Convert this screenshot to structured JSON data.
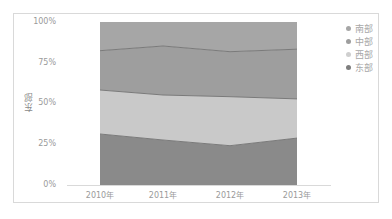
{
  "chart_data": {
    "type": "area",
    "stacked": true,
    "normalized": true,
    "title": "",
    "xlabel": "",
    "ylabel": "东部",
    "ylim": [
      0,
      100
    ],
    "y_tick_labels": [
      "0%",
      "25%",
      "50%",
      "75%",
      "100%"
    ],
    "categories": [
      "2010年",
      "2011年",
      "2012年",
      "2013年"
    ],
    "series": [
      {
        "name": "东部",
        "color": "#8a8a8a",
        "values": [
          31.3,
          27.6,
          24.1,
          28.8
        ]
      },
      {
        "name": "西部",
        "color": "#c9c9c9",
        "values": [
          27.0,
          27.6,
          30.1,
          24.0
        ]
      },
      {
        "name": "中部",
        "color": "#9e9e9e",
        "values": [
          24.1,
          30.1,
          27.6,
          30.5
        ]
      },
      {
        "name": "南部",
        "color": "#a6a6a6",
        "values": [
          17.6,
          14.7,
          18.2,
          16.7
        ]
      }
    ],
    "legend_position": "right",
    "legend_order": [
      "南部",
      "中部",
      "西部",
      "东部"
    ],
    "grid": false
  },
  "axis": {
    "y_ticks": [
      "100%",
      "75%",
      "50%",
      "25%",
      "0%"
    ],
    "y_title": "东部",
    "x_ticks": [
      "2010年",
      "2011年",
      "2012年",
      "2013年"
    ]
  },
  "legend": [
    {
      "label": "南部",
      "color": "#a6a6a6"
    },
    {
      "label": "中部",
      "color": "#9e9e9e"
    },
    {
      "label": "西部",
      "color": "#c9c9c9"
    },
    {
      "label": "东部",
      "color": "#7e7e7e"
    }
  ]
}
